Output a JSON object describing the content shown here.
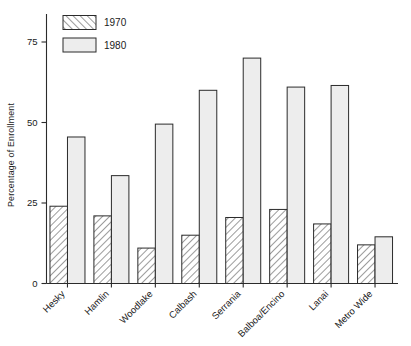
{
  "chart_data": {
    "type": "bar",
    "title": "",
    "xlabel": "",
    "ylabel": "Percentage of Enrollment",
    "ylim": [
      0,
      80
    ],
    "yticks": [
      0,
      25,
      50,
      75
    ],
    "ytick_labels": [
      "0",
      "25",
      "50",
      "75"
    ],
    "grid": false,
    "legend_position": "top-left",
    "categories": [
      "Hesky",
      "Hamlin",
      "Woodlake",
      "Calbash",
      "Serrania",
      "Balboa/Encino",
      "Lanai",
      "Metro Wide"
    ],
    "series": [
      {
        "name": "1970",
        "fill": "hatch",
        "values": [
          24,
          21,
          11,
          15,
          20.5,
          23,
          18.5,
          12
        ]
      },
      {
        "name": "1980",
        "fill": "solid-light",
        "values": [
          45.5,
          33.5,
          49.5,
          60,
          70,
          61,
          61.5,
          14.5
        ]
      }
    ]
  },
  "legend": {
    "entries": [
      {
        "label": "1970",
        "swatch": "hatched-swatch"
      },
      {
        "label": "1980",
        "swatch": "plain-swatch"
      }
    ]
  },
  "colors": {
    "axis": "#2b2b2b",
    "bar_outline": "#2b2b2b",
    "bar_1970_fill": "#ffffff",
    "bar_1970_hatch": "#4a4a4a",
    "bar_1980_fill": "#ededed",
    "background": "#ffffff"
  }
}
